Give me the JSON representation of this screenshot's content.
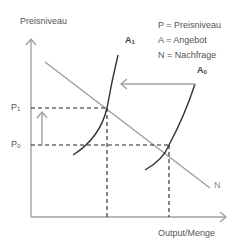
{
  "axes": {
    "y_label": "Preisniveau",
    "x_label": "Output/Menge"
  },
  "legend": [
    {
      "text": "P = Preisniveau"
    },
    {
      "text": "A = Angebot"
    },
    {
      "text": "N = Nachfrage"
    }
  ],
  "ticks": {
    "p1": {
      "base": "P",
      "sub": "1"
    },
    "p0": {
      "base": "P",
      "sub": "0"
    }
  },
  "curves": {
    "a1": {
      "base": "A",
      "sub": "1"
    },
    "a0": {
      "base": "A",
      "sub": "0"
    },
    "n": {
      "label": "N"
    }
  },
  "colors": {
    "axis": "#a0a0a0",
    "demand": "#9a9a9a",
    "supply": "#333333",
    "dashed": "#222222",
    "arrow": "#a0a0a0",
    "text": "#555555"
  }
}
